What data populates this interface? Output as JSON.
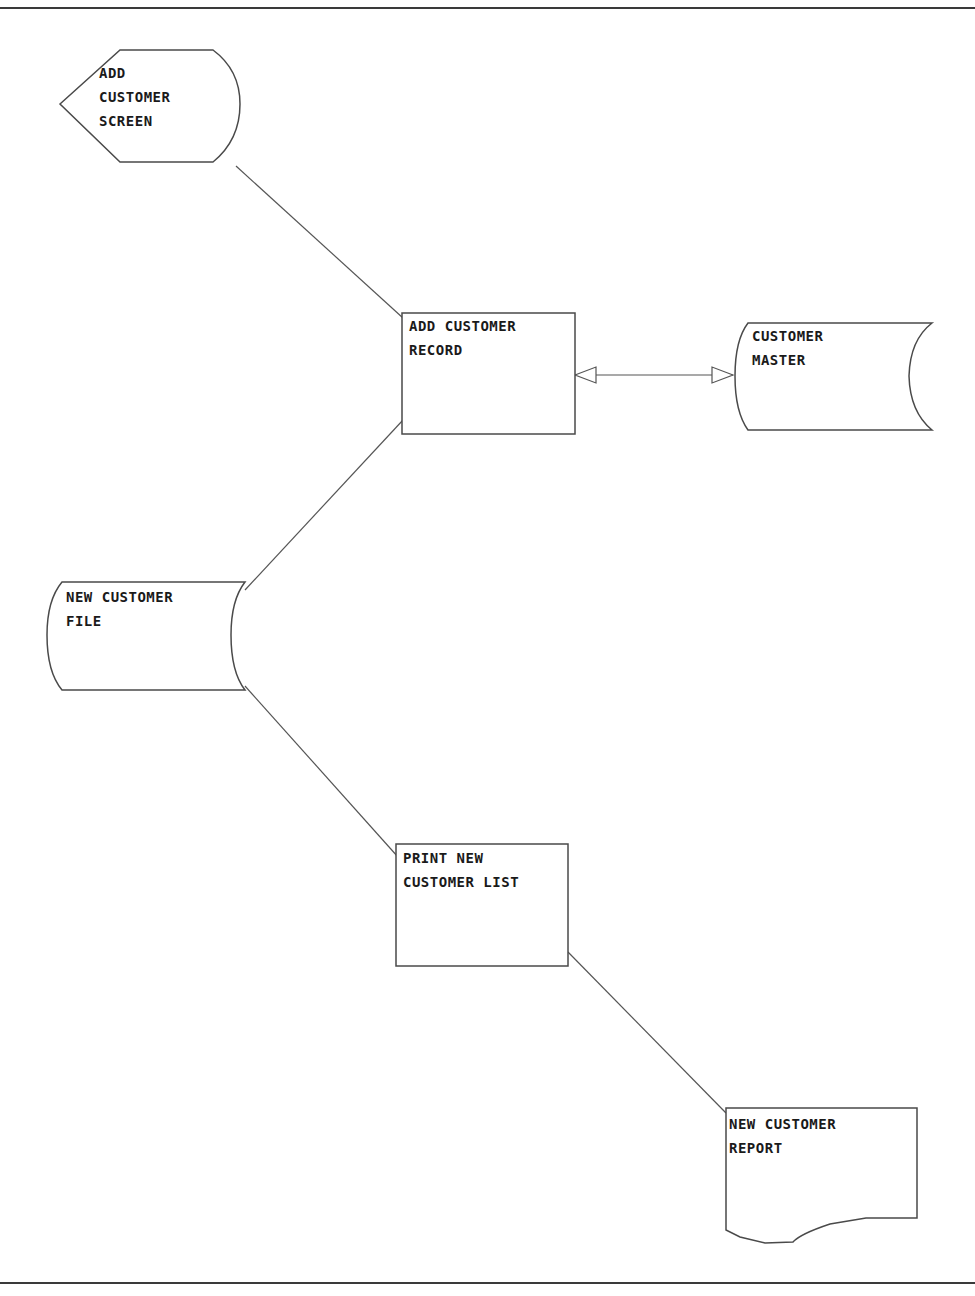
{
  "diagram": {
    "type": "system flowchart",
    "nodes": [
      {
        "id": "add-customer-screen",
        "shape": "display",
        "lines": [
          "ADD",
          "CUSTOMER",
          "SCREEN"
        ]
      },
      {
        "id": "add-customer-record",
        "shape": "process",
        "lines": [
          "ADD CUSTOMER",
          "RECORD"
        ]
      },
      {
        "id": "customer-master",
        "shape": "stored-data",
        "lines": [
          "CUSTOMER",
          "MASTER"
        ]
      },
      {
        "id": "new-customer-file",
        "shape": "stored-data",
        "lines": [
          "NEW CUSTOMER",
          "FILE"
        ]
      },
      {
        "id": "print-new-customer-list",
        "shape": "process",
        "lines": [
          "PRINT NEW",
          "CUSTOMER LIST"
        ]
      },
      {
        "id": "new-customer-report",
        "shape": "document",
        "lines": [
          "NEW CUSTOMER",
          "REPORT"
        ]
      }
    ],
    "edges": [
      {
        "from": "add-customer-screen",
        "to": "add-customer-record",
        "arrow": "none"
      },
      {
        "from": "add-customer-record",
        "to": "customer-master",
        "arrow": "both"
      },
      {
        "from": "add-customer-record",
        "to": "new-customer-file",
        "arrow": "none"
      },
      {
        "from": "new-customer-file",
        "to": "print-new-customer-list",
        "arrow": "none"
      },
      {
        "from": "print-new-customer-list",
        "to": "new-customer-report",
        "arrow": "none"
      }
    ]
  },
  "labels": {
    "add_customer_screen": "ADD\nCUSTOMER\nSCREEN",
    "add_customer_record": "ADD CUSTOMER\nRECORD",
    "customer_master": "CUSTOMER\nMASTER",
    "new_customer_file": "NEW CUSTOMER\nFILE",
    "print_new_customer_list": "PRINT NEW\nCUSTOMER LIST",
    "new_customer_report": "NEW CUSTOMER\nREPORT"
  }
}
